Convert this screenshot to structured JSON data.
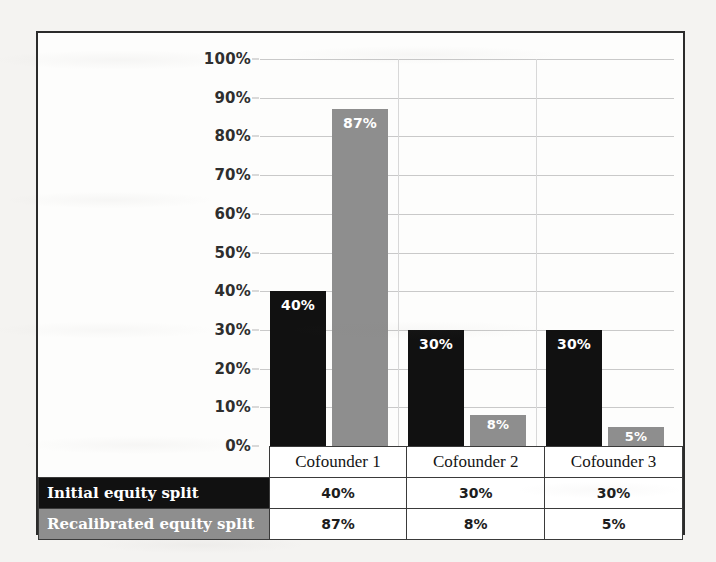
{
  "chart_data": {
    "type": "bar",
    "title": "",
    "xlabel": "",
    "ylabel": "",
    "categories": [
      "Cofounder 1",
      "Cofounder 2",
      "Cofounder 3"
    ],
    "series": [
      {
        "name": "Initial equity split",
        "values": [
          40,
          30,
          30
        ],
        "labels": [
          "40%",
          "30%",
          "30%"
        ],
        "color": "#111111"
      },
      {
        "name": "Recalibrated equity split",
        "values": [
          87,
          8,
          5
        ],
        "labels": [
          "87%",
          "8%",
          "5%"
        ],
        "color": "#8e8e8e"
      }
    ],
    "ylim": [
      0,
      100
    ],
    "ytick_values": [
      0,
      10,
      20,
      30,
      40,
      50,
      60,
      70,
      80,
      90,
      100
    ],
    "ytick_labels": [
      "0%",
      "10%",
      "20%",
      "30%",
      "40%",
      "50%",
      "60%",
      "70%",
      "80%",
      "90%",
      "100%"
    ],
    "grid": true,
    "legend": "data-table-row-headers",
    "data_labels": true
  },
  "table": {
    "corner": "",
    "column_headers": [
      "Cofounder 1",
      "Cofounder 2",
      "Cofounder 3"
    ],
    "rows": [
      {
        "header": "Initial equity split",
        "cells": [
          "40%",
          "30%",
          "30%"
        ]
      },
      {
        "header": "Recalibrated equity split",
        "cells": [
          "87%",
          "8%",
          "5%"
        ]
      }
    ]
  },
  "colors": {
    "series_initial": "#111111",
    "series_recalibrated": "#8e8e8e",
    "frame_border": "#2b2b2b",
    "gridline": "#c9c9c9",
    "page_background": "#f4f3f1",
    "chart_background": "#fdfdfc"
  }
}
